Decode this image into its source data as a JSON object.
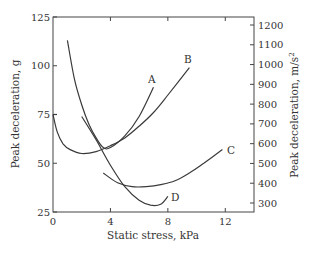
{
  "chart_data": {
    "type": "line",
    "title": "",
    "xlabel": "Static stress, kPa",
    "ylabel": "Peak deceleration, g",
    "ylabel_right": "Peak deceleration, m/s²",
    "xlim": [
      0,
      14
    ],
    "ylim": [
      25,
      125
    ],
    "ylim_right": [
      245,
      1225
    ],
    "x_ticks": [
      "0",
      "4",
      "8",
      "12"
    ],
    "y_ticks": [
      "25",
      "50",
      "75",
      "100",
      "125"
    ],
    "y_ticks_right": [
      "300",
      "400",
      "500",
      "600",
      "700",
      "800",
      "900",
      "1000",
      "1100",
      "1200"
    ],
    "grid": false,
    "legend": "inline curve labels",
    "series": [
      {
        "name": "A",
        "x": [
          1.0,
          1.5,
          2.0,
          2.5,
          3.0,
          3.5,
          4.0,
          5.0,
          6.0,
          7.0
        ],
        "y": [
          113,
          93,
          80,
          70,
          63,
          58,
          58,
          64,
          74,
          89
        ]
      },
      {
        "name": "B",
        "x": [
          0.0,
          0.3,
          0.7,
          1.2,
          2.0,
          3.0,
          4.0,
          5.0,
          6.0,
          7.0,
          8.0,
          9.5
        ],
        "y": [
          75,
          66,
          60,
          57,
          55,
          56,
          59,
          63,
          69,
          76,
          85,
          99
        ]
      },
      {
        "name": "C",
        "x": [
          3.5,
          4.5,
          5.5,
          6.5,
          7.5,
          8.5,
          9.5,
          10.5,
          11.8
        ],
        "y": [
          45,
          40,
          38,
          38,
          39,
          41,
          45,
          50,
          57
        ]
      },
      {
        "name": "D",
        "x": [
          2.0,
          3.0,
          4.0,
          5.0,
          6.0,
          6.8,
          7.5,
          8.0
        ],
        "y": [
          74,
          62,
          49,
          38,
          31,
          28.5,
          29,
          33
        ]
      }
    ]
  },
  "labels": {
    "x_title": "Static stress, kPa",
    "y_title": "Peak deceleration, g",
    "y2_title": "Peak deceleration, m/s",
    "y2_sup": "2",
    "curve_a": "A",
    "curve_b": "B",
    "curve_c": "C",
    "curve_d": "D"
  }
}
